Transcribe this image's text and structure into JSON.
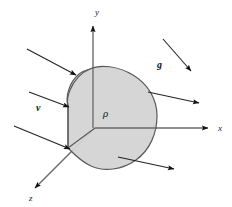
{
  "figure": {
    "background_color": "#ffffff",
    "stroke_color": "#4d4d4d",
    "arrow_color": "#111111",
    "blob_fill_color": "#d4d4d4",
    "blob_stroke_color": "#555555"
  },
  "axes": [
    {
      "name": "y-axis",
      "label": "y",
      "label_x": 95,
      "label_y": 15,
      "direction": "up"
    },
    {
      "name": "x-axis",
      "label": "x",
      "label_x": 218,
      "label_y": 131,
      "direction": "right"
    },
    {
      "name": "z-axis",
      "label": "z",
      "label_x": 29,
      "label_y": 201,
      "direction": "down-left"
    }
  ],
  "origin": {
    "x": 95,
    "y": 128
  },
  "labels": {
    "density": "ρ",
    "density_x": 103,
    "density_y": 117,
    "gravity": "g",
    "gravity_x": 157,
    "gravity_y": 68,
    "velocity": "v",
    "velocity_x": 36,
    "velocity_y": 111
  },
  "flow_arrows": {
    "incoming": [
      {
        "name": "inflow-arrow-top-left",
        "x1": 27,
        "y1": 49,
        "x2": 76,
        "y2": 75
      },
      {
        "name": "inflow-arrow-middle-left",
        "x1": 29,
        "y1": 92,
        "x2": 68,
        "y2": 106
      },
      {
        "name": "inflow-arrow-bottom-left",
        "x1": 14,
        "y1": 126,
        "x2": 68,
        "y2": 148
      }
    ],
    "outgoing": [
      {
        "name": "outflow-arrow-upper-right",
        "x1": 148,
        "y1": 92,
        "x2": 199,
        "y2": 103
      },
      {
        "name": "outflow-arrow-lower-right",
        "x1": 118,
        "y1": 157,
        "x2": 174,
        "y2": 169
      }
    ],
    "gravity_arrow": {
      "name": "gravity-vector-arrow",
      "x1": 163,
      "y1": 39,
      "x2": 191,
      "y2": 71
    }
  },
  "control_volume": {
    "name": "control-volume-blob",
    "path": "M 90 69 C 100 64, 118 66, 133 75 C 148 84, 157 99, 157 116 C 157 133, 150 150, 136 160 C 122 170, 104 172, 91 166 C 80 161, 72 152, 68 148 L 68 106 C 65 96, 70 82, 78 75 C 82 71, 86 70, 90 69 Z",
    "left_face_path": "M 90 69 C 82 72, 74 80, 70 90 C 67 97, 67 102, 68 106 L 68 148",
    "interior_edge_from_origin_to_corner": "M 95 128 L 68 148"
  }
}
